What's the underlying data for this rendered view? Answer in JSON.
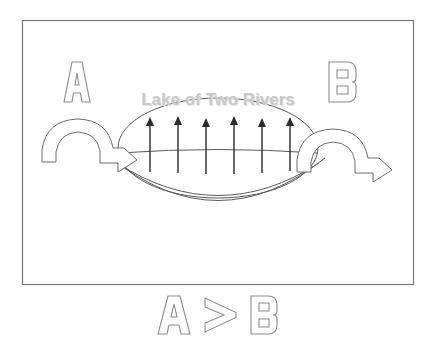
{
  "diagram": {
    "frame": {
      "name": "outer-border",
      "x": 22,
      "y": 20,
      "width": 392,
      "height": 265,
      "stroke": "#7a7a7a",
      "stroke_width": 1.2,
      "fill": "none"
    },
    "labels": {
      "left_region": "A",
      "right_region": "B",
      "lake_name": "Lake of Two Rivers",
      "comparison_left": "A",
      "comparison_operator": ">",
      "comparison_right": "B",
      "comparison_full": "A > B"
    },
    "colors": {
      "outline": "#6e6e6e",
      "lake_outline": "#5a5a5a",
      "arrow_dark": "#2b2b2b",
      "lake_text": "#c9c9c9",
      "lake_text_shadow": "#e2e2e2",
      "letter_outline": "#8c8c8c",
      "background": "#ffffff"
    },
    "lake": {
      "name": "lake-ellipse",
      "center_x": 218,
      "center_y": 148,
      "radius_x": 100,
      "radius_y": 50,
      "waterline_y": 152,
      "basin_depth_y": 222
    },
    "evaporation_arrows": {
      "count": 6,
      "direction": "up",
      "label": "evaporation",
      "x_positions": [
        150,
        178,
        206,
        234,
        262,
        290
      ],
      "tail_y": 172,
      "head_y": 119,
      "stroke": "#2b2b2b",
      "stroke_width": 1.4
    },
    "river_arrows": [
      {
        "name": "left-inflow-arrow",
        "side": "left",
        "label": "river A inflow",
        "direction": "clockwise-into-lake"
      },
      {
        "name": "right-outflow-arrow",
        "side": "right",
        "label": "river B outflow",
        "direction": "clockwise-out-of-lake"
      }
    ]
  }
}
